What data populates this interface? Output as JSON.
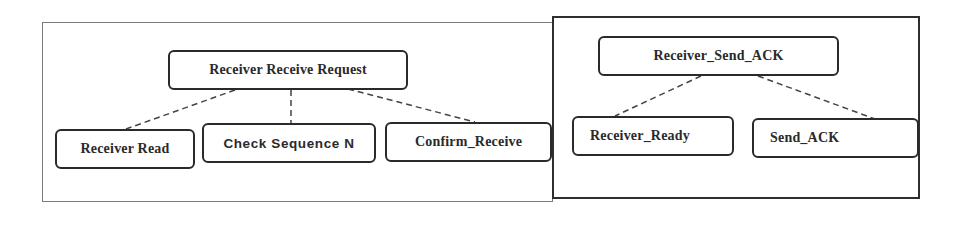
{
  "diagram": {
    "type": "hierarchy",
    "panels": [
      {
        "id": "left",
        "border": "thin-gray",
        "root": {
          "label": "Receiver Receive Request"
        },
        "children": [
          {
            "label": "Receiver Read"
          },
          {
            "label": "Check Sequence N"
          },
          {
            "label": "Confirm_Receive"
          }
        ]
      },
      {
        "id": "right",
        "border": "thick-dark",
        "root": {
          "label": "Receiver_Send_ACK"
        },
        "children": [
          {
            "label": "Receiver_Ready"
          },
          {
            "label": "Send_ACK"
          }
        ]
      }
    ],
    "edges": [
      {
        "from": "Receiver Receive Request",
        "to": "Receiver Read",
        "style": "dashed"
      },
      {
        "from": "Receiver Receive Request",
        "to": "Check Sequence N",
        "style": "dashed"
      },
      {
        "from": "Receiver Receive Request",
        "to": "Confirm_Receive",
        "style": "dashed"
      },
      {
        "from": "Receiver_Send_ACK",
        "to": "Receiver_Ready",
        "style": "dashed"
      },
      {
        "from": "Receiver_Send_ACK",
        "to": "Send_ACK",
        "style": "dashed"
      }
    ],
    "colors": {
      "node_border": "#2a2a2a",
      "text": "#2a2a2a",
      "left_panel_border": "#7a7a7a",
      "right_panel_border": "#2e2e2e",
      "connector": "#444444",
      "background": "#ffffff"
    }
  }
}
